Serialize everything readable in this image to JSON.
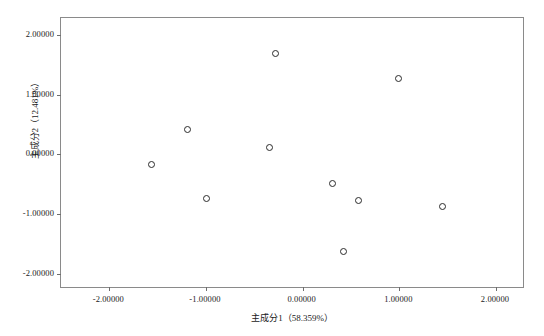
{
  "chart_data": {
    "type": "scatter",
    "title": "",
    "xlabel": "主成分1（58.359%）",
    "ylabel": "主成分2（12.481%）",
    "xlim": [
      -2.5,
      2.3
    ],
    "ylim": [
      -2.25,
      2.28
    ],
    "grid": false,
    "legend": null,
    "marker": "open-circle",
    "marker_color": "#2b2b2b",
    "frame_color": "#8a8a8a",
    "xticks": [
      -2.0,
      -1.0,
      0.0,
      1.0,
      2.0
    ],
    "xticklabels": [
      "-2.00000",
      "-1.00000",
      "0.00000",
      "1.00000",
      "2.00000"
    ],
    "yticks": [
      -2.0,
      -1.0,
      0.0,
      1.0,
      2.0
    ],
    "yticklabels": [
      "-2.00000",
      "-1.00000",
      "0.00000",
      "1.00000",
      "2.00000"
    ],
    "points": [
      {
        "x": -1.56,
        "y": -0.17
      },
      {
        "x": -1.19,
        "y": 0.41
      },
      {
        "x": -0.99,
        "y": -0.73
      },
      {
        "x": -0.34,
        "y": 0.12
      },
      {
        "x": -0.28,
        "y": 1.68
      },
      {
        "x": 0.31,
        "y": -0.48
      },
      {
        "x": 0.42,
        "y": -1.62
      },
      {
        "x": 0.58,
        "y": -0.77
      },
      {
        "x": 0.99,
        "y": 1.27
      },
      {
        "x": 1.45,
        "y": -0.87
      }
    ]
  }
}
